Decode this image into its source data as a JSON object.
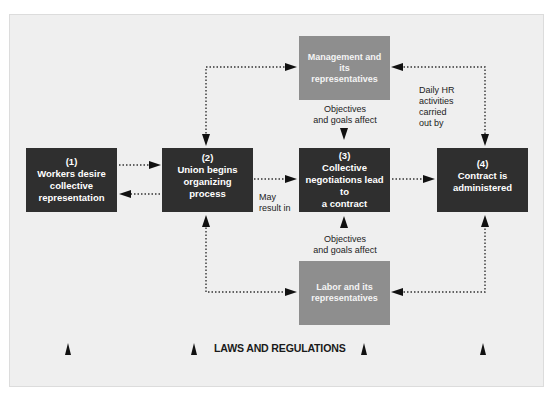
{
  "diagram": {
    "title": "",
    "boxes": [
      {
        "id": "step1",
        "number": "(1)",
        "lines": [
          "Workers desire",
          "collective",
          "representation"
        ]
      },
      {
        "id": "step2",
        "number": "(2)",
        "lines": [
          "Union begins",
          "organizing process"
        ]
      },
      {
        "id": "step3",
        "number": "(3)",
        "lines": [
          "Collective",
          "negotiations lead to",
          "a contract"
        ]
      },
      {
        "id": "step4",
        "number": "(4)",
        "lines": [
          "Contract is",
          "administered"
        ]
      }
    ],
    "management": {
      "lines": [
        "Management and its",
        "representatives"
      ]
    },
    "labor": {
      "lines": [
        "Labor and its",
        "representatives"
      ]
    },
    "labels": {
      "objectives_top": [
        "Objectives",
        "and goals affect"
      ],
      "objectives_bottom": [
        "Objectives",
        "and goals affect"
      ],
      "daily_hr": [
        "Daily HR",
        "activities",
        "carried",
        "out by"
      ],
      "may_result": [
        "May",
        "result in"
      ]
    },
    "footer": "LAWS AND REGULATIONS",
    "colors": {
      "panel_bg": "#efefef",
      "dark_box": "#2f2f2f",
      "gray_box": "#8e8e8e",
      "arrow": "#111111"
    }
  }
}
